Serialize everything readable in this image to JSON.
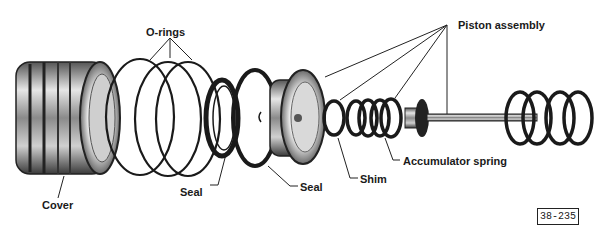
{
  "diagram": {
    "type": "exploded-parts-illustration",
    "labels": {
      "orings": "O-rings",
      "piston_assembly": "Piston assembly",
      "cover": "Cover",
      "seal_left": "Seal",
      "seal_right": "Seal",
      "shim": "Shim",
      "accumulator_spring": "Accumulator spring"
    },
    "figure_number": "38-235",
    "colors": {
      "ink": "#1a1a1a",
      "metal_light": "#d8d8d8",
      "metal_mid": "#9a9a9a",
      "metal_dark": "#3a3a3a",
      "background": "#ffffff"
    }
  }
}
